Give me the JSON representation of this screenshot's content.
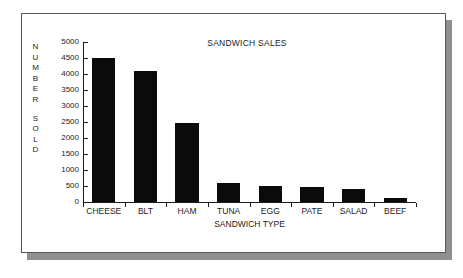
{
  "chart_data": {
    "type": "bar",
    "title": "SANDWICH SALES",
    "xlabel": "SANDWICH TYPE",
    "ylabel": "NUMBER SOLD",
    "ylabel_lines": [
      "N",
      "U",
      "M",
      "B",
      "E",
      "R",
      "S",
      "O",
      "L",
      "D"
    ],
    "categories": [
      "CHEESE",
      "BLT",
      "HAM",
      "TUNA",
      "EGG",
      "PATE",
      "SALAD",
      "BEEF"
    ],
    "values": [
      4500,
      4100,
      2480,
      580,
      510,
      470,
      420,
      130
    ],
    "ylim": [
      0,
      5000
    ],
    "ytick_step": 500,
    "yticks": [
      0,
      500,
      1000,
      1500,
      2000,
      2500,
      3000,
      3500,
      4000,
      4500,
      5000
    ],
    "ytick_labels": [
      "0",
      "500",
      "1000",
      "1500",
      "2000",
      "2500",
      "3000",
      "3500",
      "4000",
      "4500",
      "5000"
    ],
    "grid": false,
    "legend": false,
    "bar_color": "#0b0b0b",
    "axis_color": "#1b1b1b",
    "background": "#ffffff"
  },
  "figure": {
    "frame_border_color": "#55585c",
    "shadow_color": "#8f8f8f"
  }
}
